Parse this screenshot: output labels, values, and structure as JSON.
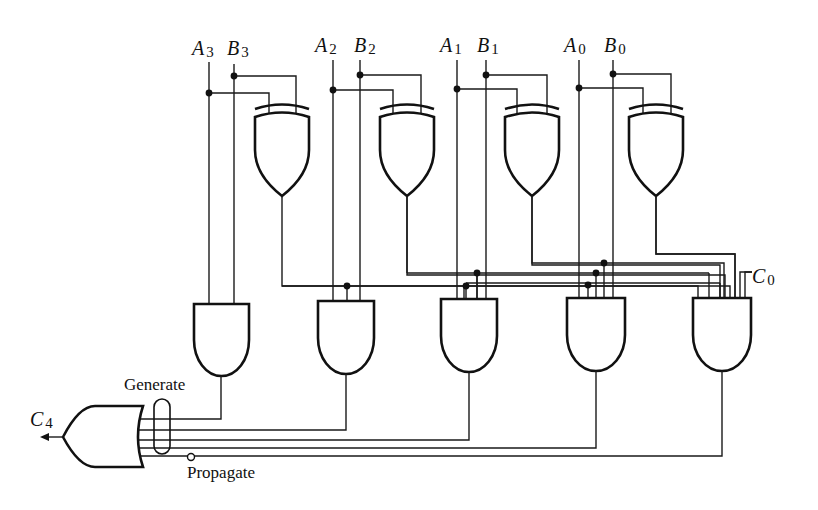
{
  "diagram": {
    "inputs": [
      {
        "name": "A",
        "sub": "3"
      },
      {
        "name": "B",
        "sub": "3"
      },
      {
        "name": "A",
        "sub": "2"
      },
      {
        "name": "B",
        "sub": "2"
      },
      {
        "name": "A",
        "sub": "1"
      },
      {
        "name": "B",
        "sub": "1"
      },
      {
        "name": "A",
        "sub": "0"
      },
      {
        "name": "B",
        "sub": "0"
      }
    ],
    "carry_in": {
      "name": "C",
      "sub": "0"
    },
    "carry_out": {
      "name": "C",
      "sub": "4"
    },
    "annotations": {
      "generate": "Generate",
      "propagate": "Propagate"
    },
    "gates": {
      "xor": [
        "XOR3",
        "XOR2",
        "XOR1",
        "XOR0"
      ],
      "and": [
        "AND-G3",
        "AND-P3G2",
        "AND-P3P2G1",
        "AND-P3P2P1G0",
        "AND-P3P2P1P0C0"
      ],
      "or": [
        "OR-C4"
      ]
    },
    "colors": {
      "ink": "#111111",
      "background": "#ffffff"
    }
  }
}
